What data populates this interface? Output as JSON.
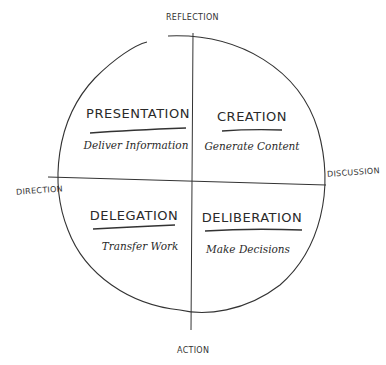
{
  "axes": {
    "top": "REFLECTION",
    "bottom": "ACTION",
    "left": "DIRECTION",
    "right": "DISCUSSION"
  },
  "quadrants": [
    {
      "position": "top-left",
      "title": "PRESENTATION",
      "subtitle": "Deliver Information"
    },
    {
      "position": "top-right",
      "title": "CREATION",
      "subtitle": "Generate Content"
    },
    {
      "position": "bottom-left",
      "title": "DELEGATION",
      "subtitle": "Transfer Work"
    },
    {
      "position": "bottom-right",
      "title": "DELIBERATION",
      "subtitle": "Make Decisions"
    }
  ],
  "colors": {
    "ink": "#2a2a2a",
    "background": "#ffffff"
  }
}
